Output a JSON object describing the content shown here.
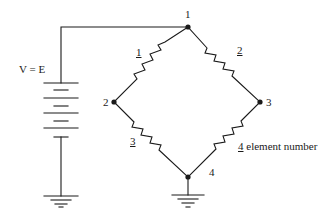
{
  "diagram": {
    "type": "Wheatstone bridge circuit",
    "source_label": "V = E",
    "nodes": [
      {
        "id": "1",
        "label": "1"
      },
      {
        "id": "2",
        "label": "2"
      },
      {
        "id": "3",
        "label": "3"
      },
      {
        "id": "4",
        "label": "4"
      }
    ],
    "elements": [
      {
        "id": "1",
        "label": "1",
        "from": "2",
        "to": "1"
      },
      {
        "id": "2",
        "label": "2",
        "from": "1",
        "to": "3"
      },
      {
        "id": "3",
        "label": "3",
        "from": "2",
        "to": "4"
      },
      {
        "id": "4",
        "label": "4",
        "from": "3",
        "to": "4"
      }
    ],
    "legend": {
      "marker": "4",
      "text": " element number"
    },
    "grounds": [
      "battery-negative",
      "node-4"
    ],
    "colors": {
      "line": "#1a1a1a",
      "background": "#ffffff"
    }
  }
}
